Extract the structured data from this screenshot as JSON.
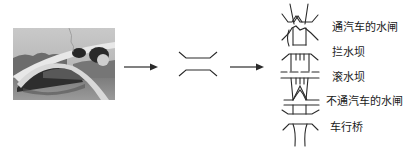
{
  "figure": {
    "stages": [
      {
        "name": "photo",
        "description": "Zhaozhou stone arch bridge photograph"
      },
      {
        "name": "abstraction",
        "description": "simplified bridge symbol"
      },
      {
        "name": "symbol-legend",
        "description": "map symbols for water structures"
      }
    ],
    "legend": {
      "items": [
        {
          "label": "通汽车的水闸"
        },
        {
          "label": "拦水坝"
        },
        {
          "label": "滚水坝"
        },
        {
          "label": "不通汽车的水闸"
        },
        {
          "label": "车行桥"
        }
      ]
    },
    "colors": {
      "ink": "#2a2a2a",
      "photo_sky": "#bdbdbd",
      "photo_bridge": "#e6e6e6",
      "photo_shadow": "#3a3a3a",
      "photo_water": "#8a8a8a"
    }
  }
}
